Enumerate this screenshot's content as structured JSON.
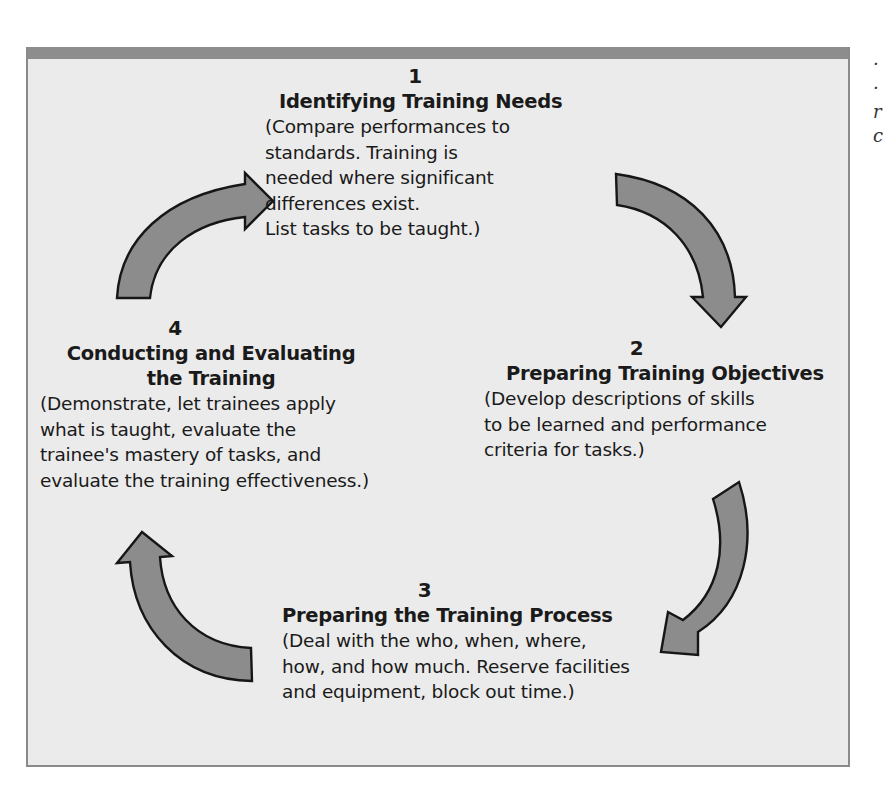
{
  "diagram": {
    "type": "cycle",
    "colors": {
      "frame_background": "#ebebeb",
      "frame_border": "#8a8a8a",
      "arrow_fill": "#8c8c8c",
      "arrow_outline": "#161616",
      "text": "#1a1a1a"
    },
    "steps": [
      {
        "number": "1",
        "title": "Identifying Training Needs",
        "description": "(Compare performances to\nstandards. Training is\nneeded where significant\ndifferences exist.\nList tasks to be taught.)"
      },
      {
        "number": "2",
        "title": "Preparing Training Objectives",
        "description": "(Develop descriptions of skills\nto be learned and performance\ncriteria for tasks.)"
      },
      {
        "number": "3",
        "title": "Preparing the Training Process",
        "description": "(Deal with the who, when, where,\nhow, and how much. Reserve facilities\nand equipment, block out time.)"
      },
      {
        "number": "4",
        "title_line1": "Conducting and Evaluating",
        "title_line2": "the Training",
        "description": "(Demonstrate, let trainees apply\nwhat is taught, evaluate the\ntrainee's mastery of tasks, and\nevaluate the training effectiveness.)"
      }
    ],
    "arrows": [
      {
        "from": "4",
        "to": "1",
        "direction": "clockwise",
        "icon": "curved-arrow-up-right"
      },
      {
        "from": "1",
        "to": "2",
        "direction": "clockwise",
        "icon": "curved-arrow-down-right"
      },
      {
        "from": "2",
        "to": "3",
        "direction": "clockwise",
        "icon": "curved-arrow-down-left"
      },
      {
        "from": "3",
        "to": "4",
        "direction": "clockwise",
        "icon": "curved-arrow-up-left"
      }
    ]
  },
  "cropped_caption": {
    "fragments": "·\n·\nr\nc"
  }
}
